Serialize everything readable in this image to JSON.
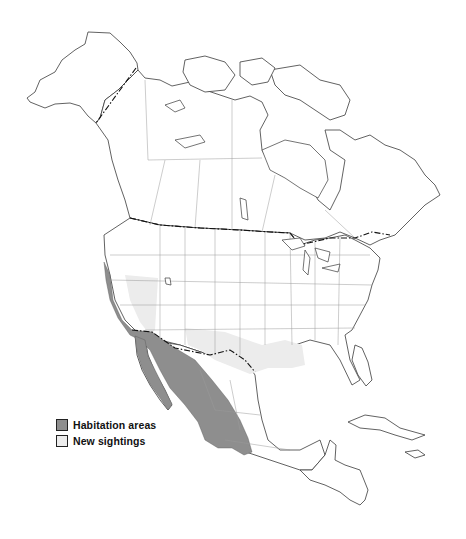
{
  "map": {
    "region": "North America",
    "colors": {
      "habitation": "#8e8e8e",
      "sightings": "#ececec",
      "outline": "#3a3a3a",
      "state_lines": "#9a9a9a"
    },
    "shaded_regions": [
      {
        "type": "habitation",
        "area": "Pacific coast of California, Baja California, western and central Mexico"
      },
      {
        "type": "sightings",
        "area": "Nevada"
      },
      {
        "type": "sightings",
        "area": "Southern New Mexico, Texas, Louisiana"
      }
    ]
  },
  "legend": {
    "items": [
      {
        "label": "Habitation areas",
        "color": "#8e8e8e"
      },
      {
        "label": "New sightings",
        "color": "#ececec"
      }
    ]
  }
}
